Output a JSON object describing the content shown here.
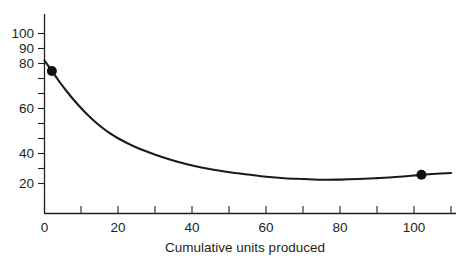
{
  "chart_data": {
    "type": "line",
    "title": "",
    "xlabel": "Cumulative units produced",
    "ylabel": "",
    "xlim": [
      0,
      110
    ],
    "ylim": [
      0,
      102
    ],
    "grid": false,
    "legend": false,
    "x_ticks_major": [
      0,
      20,
      40,
      60,
      80,
      100
    ],
    "x_ticks_minor": [
      10,
      30,
      50,
      70,
      90,
      110
    ],
    "x_tick_labels": [
      "0",
      "20",
      "40",
      "60",
      "80",
      "100"
    ],
    "y_ticks_labeled": [
      20,
      40,
      60,
      80,
      90,
      100
    ],
    "y_ticks_minor": [
      30,
      50,
      70
    ],
    "y_tick_labels": [
      "20",
      "40",
      "60",
      "80",
      "90",
      "100"
    ],
    "series": [
      {
        "name": "unit cost",
        "x": [
          0,
          2,
          4,
          6,
          8,
          10,
          12,
          14,
          16,
          18,
          20,
          24,
          28,
          32,
          36,
          40,
          45,
          50,
          55,
          60,
          65,
          70,
          75,
          80,
          85,
          90,
          95,
          100,
          102,
          105,
          110
        ],
        "values": [
          102,
          95,
          88,
          81.5,
          75.5,
          70,
          65,
          60.5,
          56.5,
          53,
          50,
          45,
          41,
          37.5,
          34.5,
          32,
          29.5,
          27.5,
          26,
          24.5,
          23.5,
          23,
          22.5,
          22.6,
          23,
          23.6,
          24.3,
          25.3,
          25.8,
          26.3,
          27
        ]
      }
    ],
    "markers": [
      {
        "x": 2,
        "y": 95
      },
      {
        "x": 102,
        "y": 25.8
      }
    ]
  },
  "axis": {
    "x_title": "Cumulative units produced"
  },
  "labels": {
    "y": [
      "100",
      "90",
      "80",
      "60",
      "40",
      "20"
    ],
    "x": [
      "0",
      "20",
      "40",
      "60",
      "80",
      "100"
    ]
  }
}
